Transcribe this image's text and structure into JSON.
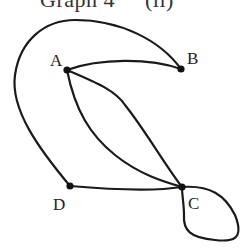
{
  "title": {
    "main": "Graph 4",
    "sub": "(ii)"
  },
  "graph": {
    "nodes": [
      {
        "id": "A",
        "label": "A",
        "x": 67,
        "y": 70
      },
      {
        "id": "B",
        "label": "B",
        "x": 181,
        "y": 69
      },
      {
        "id": "C",
        "label": "C",
        "x": 182,
        "y": 187
      },
      {
        "id": "D",
        "label": "D",
        "x": 70,
        "y": 186
      }
    ],
    "edges": [
      {
        "from": "A",
        "to": "B",
        "kind": "curve"
      },
      {
        "from": "B",
        "to": "D",
        "kind": "outer-arc"
      },
      {
        "from": "A",
        "to": "C",
        "kind": "curve-upper"
      },
      {
        "from": "A",
        "to": "C",
        "kind": "curve-lower"
      },
      {
        "from": "D",
        "to": "C",
        "kind": "curve"
      },
      {
        "from": "C",
        "to": "C",
        "kind": "loop"
      }
    ],
    "vertex_count": 4,
    "edge_count": 6
  },
  "colors": {
    "stroke": "#1a1a1a",
    "node": "#111111",
    "background": "#ffffff"
  }
}
